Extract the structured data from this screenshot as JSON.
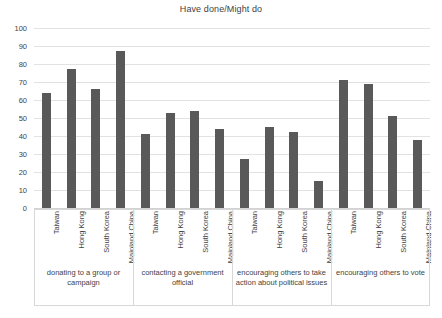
{
  "chart_data": {
    "type": "bar",
    "title": "Have done/Might do",
    "xlabel": "",
    "ylabel": "",
    "ylim": [
      0,
      100
    ],
    "ytick_step": 10,
    "yticks": [
      100,
      90,
      80,
      70,
      60,
      50,
      40,
      30,
      20,
      10,
      0
    ],
    "grid": true,
    "legend": "none",
    "bar_color": "#595959",
    "groups": [
      {
        "label": "donating to a group or campaign",
        "categories": [
          "Taiwan",
          "Hong Kong",
          "South Korea",
          "Mainland China"
        ],
        "values": [
          64,
          77,
          66,
          87
        ]
      },
      {
        "label": "contacting a government official",
        "categories": [
          "Taiwan",
          "Hong Kong",
          "South Korea",
          "Mainland China"
        ],
        "values": [
          41,
          53,
          54,
          44
        ]
      },
      {
        "label": "encouraging others to take action about political issues",
        "categories": [
          "Taiwan",
          "Hong Kong",
          "South Korea",
          "Mainland China"
        ],
        "values": [
          27,
          45,
          42,
          15
        ]
      },
      {
        "label": "encouraging others to vote",
        "categories": [
          "Taiwan",
          "Hong Kong",
          "South Korea",
          "Mainland China"
        ],
        "values": [
          71,
          69,
          51,
          38
        ]
      }
    ],
    "categories": [
      "Taiwan",
      "Hong Kong",
      "South Korea",
      "Mainland China"
    ],
    "series": [
      {
        "name": "Taiwan",
        "values": [
          64,
          41,
          27,
          71
        ]
      },
      {
        "name": "Hong Kong",
        "values": [
          77,
          53,
          45,
          69
        ]
      },
      {
        "name": "South Korea",
        "values": [
          66,
          54,
          42,
          51
        ]
      },
      {
        "name": "Mainland China",
        "values": [
          87,
          44,
          15,
          38
        ]
      }
    ]
  }
}
